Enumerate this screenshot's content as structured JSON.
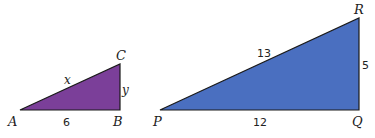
{
  "triangles": [
    {
      "name": "ABC",
      "fill": "#7b3f99",
      "vertices": {
        "A": "A",
        "B": "B",
        "C": "C"
      },
      "sides": {
        "AB": "6",
        "AC": "x",
        "BC": "y"
      }
    },
    {
      "name": "PQR",
      "fill": "#4a6fc0",
      "vertices": {
        "P": "P",
        "Q": "Q",
        "R": "R"
      },
      "sides": {
        "PQ": "12",
        "PR": "13",
        "QR": "5"
      }
    }
  ]
}
